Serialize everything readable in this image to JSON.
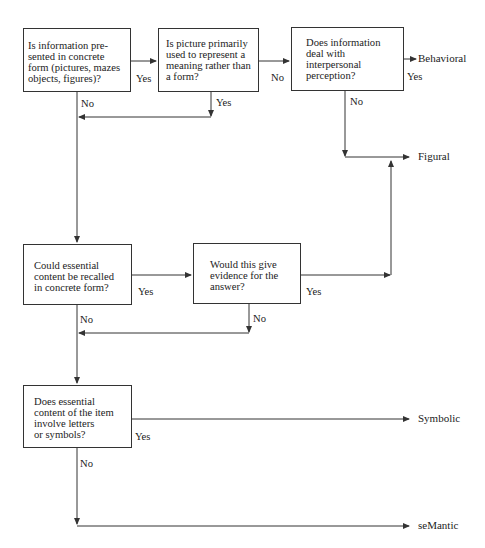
{
  "diagram": {
    "type": "flowchart",
    "nodes": {
      "q1": "Is information pre-\nsented in concrete\nform (pictures, mazes\nobjects, figures)?",
      "q2": "Is picture primarily\nused to represent a\nmeaning rather than\na form?",
      "q3": "Does information\ndeal with\ninterpersonal\nperception?",
      "q4": "Could essential\ncontent be recalled\nin concrete form?",
      "q5": "Would this give\nevidence for the\nanswer?",
      "q6": "Does essential\ncontent of the item\ninvolve letters\nor symbols?"
    },
    "outcomes": {
      "behavioral": "Behavioral",
      "figural": "Figural",
      "symbolic": "Symbolic",
      "semantic": "seMantic"
    },
    "edge_labels": {
      "q1_yes": "Yes",
      "q1_no": "No",
      "q2_no": "No",
      "q2_yes": "Yes",
      "q3_yes": "Yes",
      "q3_no": "No",
      "q4_yes": "Yes",
      "q4_no": "No",
      "q5_yes": "Yes",
      "q5_no": "No",
      "q6_yes": "Yes",
      "q6_no": "No"
    },
    "edges": [
      {
        "from": "q1",
        "to": "q2",
        "label": "Yes"
      },
      {
        "from": "q1",
        "to": "q4",
        "label": "No"
      },
      {
        "from": "q2",
        "to": "q3",
        "label": "No"
      },
      {
        "from": "q2",
        "to": "q4",
        "label": "Yes"
      },
      {
        "from": "q3",
        "to": "Behavioral",
        "label": "Yes"
      },
      {
        "from": "q3",
        "to": "Figural",
        "label": "No"
      },
      {
        "from": "q4",
        "to": "q5",
        "label": "Yes"
      },
      {
        "from": "q4",
        "to": "q6",
        "label": "No"
      },
      {
        "from": "q5",
        "to": "Figural",
        "label": "Yes"
      },
      {
        "from": "q5",
        "to": "q6",
        "label": "No"
      },
      {
        "from": "q6",
        "to": "Symbolic",
        "label": "Yes"
      },
      {
        "from": "q6",
        "to": "seMantic",
        "label": "No"
      }
    ],
    "colors": {
      "line": "#333333",
      "text": "#222222",
      "background": "#ffffff"
    }
  }
}
